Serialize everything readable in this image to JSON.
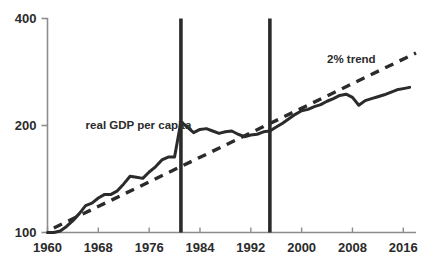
{
  "chart_data": {
    "type": "line",
    "title": "",
    "subtitle": "",
    "xlabel": "",
    "ylabel": "",
    "yscale": "log",
    "ylim": [
      100,
      400
    ],
    "xlim": [
      1960,
      2018
    ],
    "grid": false,
    "legend": "none",
    "yticks": [
      100,
      200,
      400
    ],
    "ytick_labels": [
      "100",
      "200",
      "400"
    ],
    "xticks": [
      1960,
      1968,
      1976,
      1984,
      1992,
      2000,
      2008,
      2016
    ],
    "xtick_labels": [
      "1960",
      "1968",
      "1976",
      "1984",
      "1992",
      "2000",
      "2008",
      "2016"
    ],
    "annotations": [
      {
        "name": "series-label-gdp",
        "text": "real GDP per capita",
        "x": 1966,
        "y": 196
      },
      {
        "name": "series-label-trend",
        "text": "2% trend",
        "x": 2004,
        "y": 300
      }
    ],
    "vlines": [
      {
        "name": "vline-1981",
        "x": 1981
      },
      {
        "name": "vline-1995",
        "x": 1995
      }
    ],
    "series": [
      {
        "name": "real GDP per capita",
        "style": "solid",
        "color": "#2b2b2b",
        "x": [
          1960,
          1961,
          1962,
          1963,
          1964,
          1965,
          1966,
          1967,
          1968,
          1969,
          1970,
          1971,
          1972,
          1973,
          1974,
          1975,
          1976,
          1977,
          1978,
          1979,
          1980,
          1981,
          1982,
          1983,
          1984,
          1985,
          1986,
          1987,
          1988,
          1989,
          1990,
          1991,
          1992,
          1993,
          1994,
          1995,
          1996,
          1997,
          1998,
          1999,
          2000,
          2001,
          2002,
          2003,
          2004,
          2005,
          2006,
          2007,
          2008,
          2009,
          2010,
          2011,
          2012,
          2013,
          2014,
          2015,
          2016,
          2017
        ],
        "values": [
          100,
          100,
          101,
          104,
          108,
          113,
          119,
          121,
          125,
          128,
          128,
          131,
          137,
          144,
          143,
          142,
          148,
          153,
          160,
          163,
          163,
          205,
          198,
          191,
          195,
          196,
          193,
          190,
          192,
          193,
          189,
          186,
          188,
          189,
          192,
          193,
          198,
          203,
          209,
          215,
          220,
          222,
          226,
          229,
          234,
          238,
          243,
          245,
          240,
          228,
          235,
          238,
          241,
          244,
          248,
          252,
          254,
          256
        ]
      },
      {
        "name": "2% trend",
        "style": "dashed",
        "color": "#2b2b2b",
        "x": [
          1961,
          2018
        ],
        "values": [
          103,
          320
        ]
      }
    ]
  },
  "axis": {
    "color": "#8c8c8c",
    "tick_color": "#8c8c8c"
  },
  "colors": {
    "background": "#ffffff",
    "ink": "#2b2b2b",
    "axis": "#8c8c8c"
  }
}
